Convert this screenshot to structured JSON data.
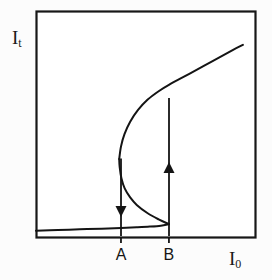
{
  "figure": {
    "kind": "bistability-hysteresis-curve",
    "background_color": "#fcfcfc",
    "line_color": "#141414",
    "frame": {
      "x": 36,
      "y": 11,
      "width": 219,
      "height": 226
    }
  },
  "axes": {
    "y_label_base": "I",
    "y_label_sub": "t",
    "x_label_base": "I",
    "x_label_sub": "0"
  },
  "ticks": {
    "a_label": "A",
    "b_label": "B",
    "a_x": 121,
    "b_x": 169
  },
  "chart_data": {
    "type": "line",
    "title": "",
    "xlabel": "I_0",
    "ylabel": "I_t",
    "grid": false,
    "legend": null,
    "xlim": [
      0,
      1
    ],
    "ylim": [
      0,
      1
    ],
    "annotations": [
      {
        "text": "A",
        "x": 0.388,
        "y": 0.0,
        "role": "x-tick-switch-down"
      },
      {
        "text": "B",
        "x": 0.607,
        "y": 0.0,
        "role": "x-tick-switch-up"
      }
    ],
    "series": [
      {
        "name": "S-curve (lower branch, stable)",
        "comment": "nearly flat low-transmission branch rising slowly to the lower turning point B",
        "points": [
          [
            0.0,
            0.028
          ],
          [
            0.1,
            0.031
          ],
          [
            0.2,
            0.034
          ],
          [
            0.3,
            0.037
          ],
          [
            0.388,
            0.04
          ],
          [
            0.46,
            0.043
          ],
          [
            0.52,
            0.046
          ],
          [
            0.57,
            0.05
          ],
          [
            0.607,
            0.057
          ]
        ]
      },
      {
        "name": "S-curve (middle branch, unstable)",
        "comment": "negative-slope branch folding back from lower turning point B to upper turning point A",
        "points": [
          [
            0.607,
            0.057
          ],
          [
            0.56,
            0.078
          ],
          [
            0.51,
            0.105
          ],
          [
            0.46,
            0.142
          ],
          [
            0.43,
            0.175
          ],
          [
            0.405,
            0.215
          ],
          [
            0.39,
            0.26
          ],
          [
            0.382,
            0.31
          ],
          [
            0.38,
            0.345
          ]
        ]
      },
      {
        "name": "S-curve (upper branch, stable)",
        "comment": "high-transmission branch rising from upper turning point A to top right",
        "points": [
          [
            0.38,
            0.345
          ],
          [
            0.388,
            0.4
          ],
          [
            0.404,
            0.455
          ],
          [
            0.43,
            0.51
          ],
          [
            0.466,
            0.562
          ],
          [
            0.51,
            0.608
          ],
          [
            0.56,
            0.645
          ],
          [
            0.607,
            0.673
          ],
          [
            0.7,
            0.722
          ],
          [
            0.8,
            0.775
          ],
          [
            0.9,
            0.828
          ],
          [
            0.945,
            0.85
          ]
        ]
      }
    ],
    "transitions": [
      {
        "name": "switch-down-at-A",
        "direction": "down",
        "x": 0.388,
        "y_from": 0.345,
        "y_to": 0.0,
        "arrowhead_y": 0.12
      },
      {
        "name": "switch-up-at-B",
        "direction": "up",
        "x": 0.607,
        "y_from": 0.0,
        "y_to": 0.673,
        "arrowhead_y": 0.33
      }
    ]
  }
}
